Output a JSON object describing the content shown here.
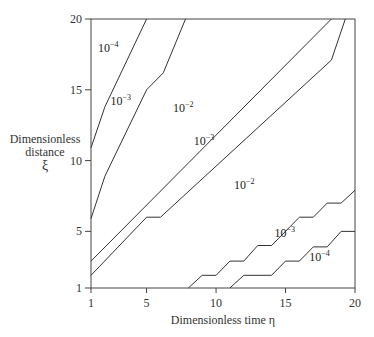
{
  "chart_data": {
    "type": "line",
    "subtype": "contour",
    "title": "",
    "xlabel": "Dimensionless time η",
    "ylabel": [
      "Dimensionless",
      "distance",
      "ξ"
    ],
    "xlim": [
      1,
      20
    ],
    "ylim": [
      1,
      20
    ],
    "xticks": [
      1,
      5,
      10,
      15,
      20
    ],
    "yticks": [
      1,
      5,
      10,
      15,
      20
    ],
    "grid": false,
    "legend": null,
    "contours": [
      {
        "name": "upper 1e-4 boundary",
        "level": "10^-4",
        "points": [
          [
            1,
            10.9
          ],
          [
            2,
            13.8
          ],
          [
            5,
            20
          ]
        ]
      },
      {
        "name": "upper 1e-3 boundary",
        "level": "10^-3",
        "points": [
          [
            1,
            5.9
          ],
          [
            2,
            8.9
          ],
          [
            5,
            15
          ],
          [
            6.2,
            16.2
          ],
          [
            7.8,
            20
          ]
        ]
      },
      {
        "name": "diagonal 1e-2 upper",
        "level": "10^-2",
        "points": [
          [
            1,
            2.9
          ],
          [
            18.3,
            20
          ]
        ]
      },
      {
        "name": "diagonal 1e-3 lower",
        "level": "10^-3",
        "points": [
          [
            1,
            1.9
          ],
          [
            5,
            6
          ],
          [
            6,
            6
          ],
          [
            18.3,
            17.1
          ],
          [
            19.3,
            20
          ]
        ]
      },
      {
        "name": "lower staircase 1e-3",
        "level": "10^-3",
        "points": [
          [
            8,
            1
          ],
          [
            9,
            1.9
          ],
          [
            10,
            1.9
          ],
          [
            11,
            2.9
          ],
          [
            12,
            2.9
          ],
          [
            13,
            4
          ],
          [
            14,
            4
          ],
          [
            16,
            6
          ],
          [
            17,
            6
          ],
          [
            18,
            7
          ],
          [
            19,
            7
          ],
          [
            20,
            7.9
          ]
        ]
      },
      {
        "name": "lower staircase 1e-4",
        "level": "10^-4",
        "points": [
          [
            11,
            1
          ],
          [
            12,
            1.9
          ],
          [
            14,
            1.9
          ],
          [
            15,
            2.9
          ],
          [
            16,
            2.9
          ],
          [
            17,
            3.9
          ],
          [
            18,
            3.9
          ],
          [
            19,
            5
          ],
          [
            20,
            5
          ]
        ]
      }
    ],
    "annotations": [
      {
        "text": "10",
        "exp": "−4",
        "x": 1.5,
        "y": 17.7
      },
      {
        "text": "10",
        "exp": "−3",
        "x": 2.4,
        "y": 13.9
      },
      {
        "text": "10",
        "exp": "−2",
        "x": 6.9,
        "y": 13.4
      },
      {
        "text": "10",
        "exp": "−3",
        "x": 8.4,
        "y": 11.1
      },
      {
        "text": "10",
        "exp": "−2",
        "x": 11.3,
        "y": 8.0
      },
      {
        "text": "10",
        "exp": "−3",
        "x": 14.2,
        "y": 4.6
      },
      {
        "text": "10",
        "exp": "−4",
        "x": 16.7,
        "y": 2.9
      }
    ]
  }
}
